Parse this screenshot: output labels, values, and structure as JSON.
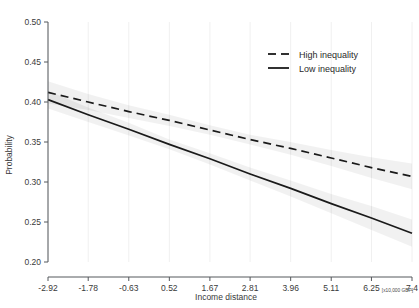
{
  "chart_data": {
    "type": "line",
    "title": "",
    "xlabel": "Income distance",
    "ylabel": "Probability",
    "x_unit_note": "[x10,000 GBP]",
    "xlim": [
      -2.92,
      7.4
    ],
    "ylim": [
      0.2,
      0.5
    ],
    "grid": "vertical-faint",
    "legend_position": "top-right-inside",
    "x_tick_labels": [
      "-2.92",
      "-1.78",
      "-0.63",
      "0.52",
      "1.67",
      "2.81",
      "3.96",
      "5.11",
      "6.25",
      "7.4"
    ],
    "x_tick_values": [
      -2.92,
      -1.78,
      -0.63,
      0.52,
      1.67,
      2.81,
      3.96,
      5.11,
      6.25,
      7.4
    ],
    "y_tick_labels": [
      "0.50",
      "0.45",
      "0.40",
      "0.35",
      "0.30",
      "0.25",
      "0.20"
    ],
    "y_tick_values": [
      0.5,
      0.45,
      0.4,
      0.35,
      0.3,
      0.25,
      0.2
    ],
    "x": [
      -2.92,
      -1.78,
      -0.63,
      0.52,
      1.67,
      2.81,
      3.96,
      5.11,
      6.25,
      7.4
    ],
    "series": [
      {
        "name": "High inequality",
        "style": "dashed",
        "color": "#1a1a1a",
        "values": [
          0.412,
          0.4,
          0.388,
          0.377,
          0.365,
          0.353,
          0.342,
          0.33,
          0.318,
          0.307
        ],
        "ci_lower": [
          0.398,
          0.39,
          0.38,
          0.37,
          0.359,
          0.347,
          0.334,
          0.32,
          0.305,
          0.291
        ],
        "ci_upper": [
          0.426,
          0.41,
          0.396,
          0.384,
          0.371,
          0.359,
          0.35,
          0.34,
          0.331,
          0.323
        ]
      },
      {
        "name": "Low inequality",
        "style": "solid",
        "color": "#1a1a1a",
        "values": [
          0.403,
          0.384,
          0.366,
          0.347,
          0.329,
          0.31,
          0.292,
          0.273,
          0.255,
          0.236
        ],
        "ci_lower": [
          0.392,
          0.375,
          0.358,
          0.341,
          0.322,
          0.302,
          0.282,
          0.261,
          0.24,
          0.219
        ],
        "ci_upper": [
          0.414,
          0.393,
          0.374,
          0.353,
          0.336,
          0.318,
          0.302,
          0.285,
          0.27,
          0.253
        ]
      }
    ]
  },
  "legend": {
    "entries": [
      {
        "label": "High inequality"
      },
      {
        "label": "Low inequality"
      }
    ]
  }
}
